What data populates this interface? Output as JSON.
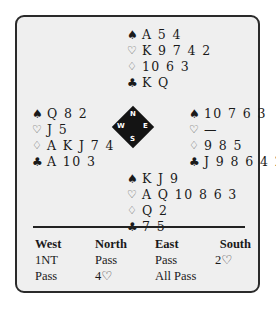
{
  "symbols": {
    "spades": "♠",
    "hearts": "♡",
    "diamonds": "♢",
    "clubs": "♣"
  },
  "hands": {
    "north": {
      "spades": "A 5 4",
      "hearts": "K 9 7 4 2",
      "diamonds": "10 6 3",
      "clubs": "K Q"
    },
    "west": {
      "spades": "Q 8 2",
      "hearts": "J 5",
      "diamonds": "A K J 7 4",
      "clubs": "A 10 3"
    },
    "east": {
      "spades": "10 7 6 3",
      "hearts": "—",
      "diamonds": "9 8 5",
      "clubs": "J 9 8 6 4 2"
    },
    "south": {
      "spades": "K J 9",
      "hearts": "A Q 10 8 6 3",
      "diamonds": "Q 2",
      "clubs": "7 5"
    }
  },
  "compass": {
    "n": "N",
    "s": "S",
    "w": "W",
    "e": "E"
  },
  "auction": {
    "headers": [
      "West",
      "North",
      "East",
      "South"
    ],
    "rows": [
      [
        "1NT",
        "Pass",
        "Pass",
        "2♡"
      ],
      [
        "Pass",
        "4♡",
        "All Pass",
        ""
      ]
    ]
  }
}
